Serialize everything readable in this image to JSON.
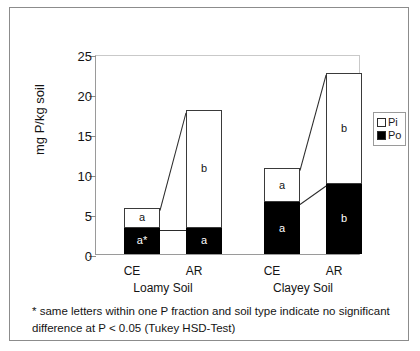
{
  "chart_data": {
    "type": "bar",
    "title": "",
    "subtitle": "",
    "xlabel": "",
    "ylabel": "mg P/kg soil",
    "ylim": [
      0,
      25
    ],
    "yticks": [
      0,
      5,
      10,
      15,
      20,
      25
    ],
    "ytick_labels": [
      "0",
      "5",
      "10",
      "15",
      "20",
      "25"
    ],
    "grid": false,
    "stacked": true,
    "legend_position": "right",
    "legend": [
      "Pi",
      "Po"
    ],
    "series": [
      {
        "name": "Pi",
        "fill": "white",
        "values": [
          2.5,
          14.7,
          4.2,
          13.8
        ]
      },
      {
        "name": "Po",
        "fill": "black",
        "values": [
          3.3,
          3.3,
          6.5,
          8.8
        ]
      }
    ],
    "categories": [
      "CE",
      "AR",
      "CE",
      "AR"
    ],
    "group_labels": [
      "Loamy Soil",
      "Clayey Soil"
    ],
    "totals": [
      5.8,
      18.0,
      10.7,
      22.6
    ],
    "annotations": [
      {
        "bar": "Loamy CE",
        "series": "Pi",
        "letter": "a"
      },
      {
        "bar": "Loamy CE",
        "series": "Po",
        "letter": "a*"
      },
      {
        "bar": "Loamy AR",
        "series": "Pi",
        "letter": "b"
      },
      {
        "bar": "Loamy AR",
        "series": "Po",
        "letter": "a"
      },
      {
        "bar": "Clayey CE",
        "series": "Pi",
        "letter": "a"
      },
      {
        "bar": "Clayey CE",
        "series": "Po",
        "letter": "a"
      },
      {
        "bar": "Clayey AR",
        "series": "Pi",
        "letter": "b"
      },
      {
        "bar": "Clayey AR",
        "series": "Po",
        "letter": "b"
      }
    ],
    "footnote_line1": "* same letters within one P fraction and soil type indicate no significant",
    "footnote_line2": "difference at P < 0.05  (Tukey HSD-Test)"
  },
  "axis": {
    "y_title": "mg P/kg soil",
    "ticks": [
      "0",
      "5",
      "10",
      "15",
      "20",
      "25"
    ]
  },
  "bars": [
    {
      "id": "loamy-ce",
      "category": "CE",
      "pi_label": "a",
      "po_label": "a*"
    },
    {
      "id": "loamy-ar",
      "category": "AR",
      "pi_label": "b",
      "po_label": "a"
    },
    {
      "id": "clayey-ce",
      "category": "CE",
      "pi_label": "a",
      "po_label": "a"
    },
    {
      "id": "clayey-ar",
      "category": "AR",
      "pi_label": "b",
      "po_label": "b"
    }
  ],
  "groups": [
    {
      "label": "Loamy Soil"
    },
    {
      "label": "Clayey Soil"
    }
  ],
  "legend": {
    "pi": "Pi",
    "po": "Po"
  },
  "footnote": {
    "line1": "* same letters within one P fraction and soil type indicate no significant",
    "line2": "difference at P < 0.05  (Tukey HSD-Test)"
  },
  "colors": {
    "pi_fill": "#ffffff",
    "po_fill": "#000000",
    "outline": "#2b2b2b",
    "axis": "#8a8a8a",
    "frame": "#8c8c8c",
    "text": "#141414"
  }
}
